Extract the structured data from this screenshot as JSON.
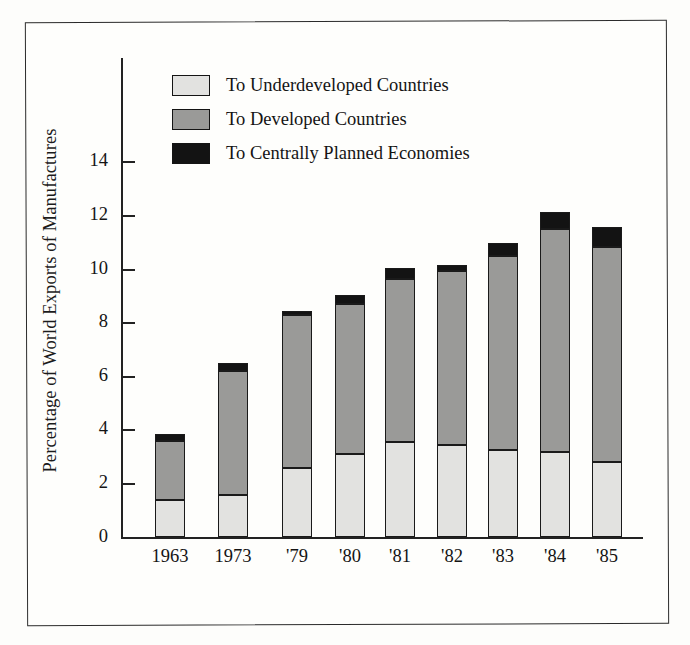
{
  "figure": {
    "y_axis_title": "Percentage of World Exports of Manufactures"
  },
  "legend": {
    "items": [
      {
        "label": "To Underdeveloped Countries",
        "color": "#e2e2e0",
        "key": "underdeveloped"
      },
      {
        "label": "To Developed Countries",
        "color": "#9a9a98",
        "key": "developed"
      },
      {
        "label": "To Centrally Planned Economies",
        "color": "#131313",
        "key": "centrally_planned"
      }
    ]
  },
  "chart_data": {
    "type": "bar",
    "stacked": true,
    "title": "",
    "xlabel": "",
    "ylabel": "Percentage of World Exports of Manufactures",
    "categories": [
      "1963",
      "1973",
      "'79",
      "'80",
      "'81",
      "'82",
      "'83",
      "'84",
      "'85"
    ],
    "series": [
      {
        "name": "To Underdeveloped Countries",
        "color": "#e2e2e0",
        "values": [
          1.4,
          1.6,
          2.6,
          3.1,
          3.55,
          3.45,
          3.25,
          3.2,
          2.8
        ]
      },
      {
        "name": "To Developed Countries",
        "color": "#9a9a98",
        "values": [
          2.2,
          4.6,
          5.7,
          5.6,
          6.1,
          6.5,
          7.25,
          8.3,
          8.05
        ]
      },
      {
        "name": "To Centrally Planned Economies",
        "color": "#131313",
        "values": [
          0.25,
          0.3,
          0.15,
          0.35,
          0.4,
          0.2,
          0.5,
          0.65,
          0.75
        ]
      }
    ],
    "totals": [
      3.85,
      6.5,
      8.45,
      9.05,
      10.05,
      10.15,
      11.0,
      12.15,
      11.6
    ],
    "yticks": [
      0,
      2,
      4,
      6,
      8,
      10,
      12,
      14
    ],
    "ytick_labels": [
      "0",
      "2",
      "4",
      "6",
      "8",
      "10",
      "12",
      "14"
    ],
    "ylim": [
      0,
      15
    ],
    "grid": false,
    "legend_position": "top-left"
  }
}
